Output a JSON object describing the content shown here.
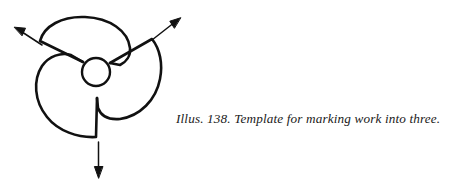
{
  "figure": {
    "name": "three-lobe-marking-template",
    "background_color": "#ffffff",
    "stroke_color": "#111111",
    "center_hole": {
      "label": "center-hole",
      "cx": 96,
      "cy": 72,
      "r": 14
    },
    "lobes": [
      {
        "label": "top-lobe"
      },
      {
        "label": "right-lobe"
      },
      {
        "label": "left-lobe"
      }
    ],
    "arrows": [
      {
        "label": "arrow-upper-left",
        "direction": "up-left"
      },
      {
        "label": "arrow-upper-right",
        "direction": "up-right"
      },
      {
        "label": "arrow-down",
        "direction": "down"
      }
    ]
  },
  "caption": {
    "figure_number": "Illus. 138.",
    "text": "Illus. 138. Template for marking work into three.",
    "title": "Template for marking work into three."
  }
}
